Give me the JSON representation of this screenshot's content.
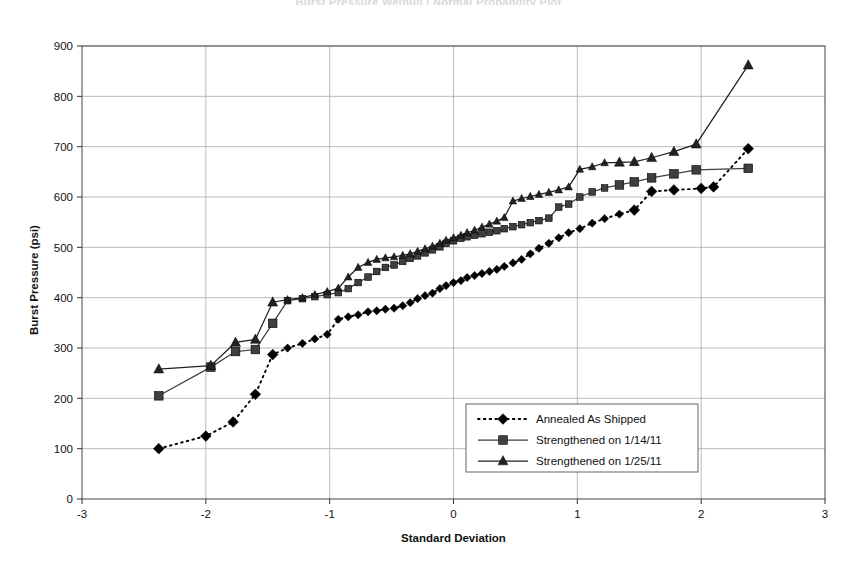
{
  "chart_data": {
    "type": "line",
    "title": "Burst Pressure Weibull / Normal Probability Plot",
    "xlabel": "Standard Deviation",
    "ylabel": "Burst Pressure (psi)",
    "xlim": [
      -3,
      3
    ],
    "ylim": [
      0,
      900
    ],
    "xticks": [
      -3,
      -2,
      -1,
      0,
      1,
      2,
      3
    ],
    "yticks": [
      0,
      100,
      200,
      300,
      400,
      500,
      600,
      700,
      800,
      900
    ],
    "grid": true,
    "legend_position": "center-right-inside",
    "series": [
      {
        "name": "Annealed As Shipped",
        "marker": "diamond",
        "line_style": "dotted",
        "color": "#000000",
        "points": [
          [
            -2.38,
            100
          ],
          [
            -2.0,
            125
          ],
          [
            -1.78,
            153
          ],
          [
            -1.6,
            208
          ],
          [
            -1.46,
            287
          ],
          [
            -1.34,
            300
          ],
          [
            -1.22,
            309
          ],
          [
            -1.12,
            318
          ],
          [
            -1.02,
            327
          ],
          [
            -0.93,
            357
          ],
          [
            -0.85,
            362
          ],
          [
            -0.77,
            366
          ],
          [
            -0.69,
            372
          ],
          [
            -0.62,
            374
          ],
          [
            -0.55,
            377
          ],
          [
            -0.48,
            379
          ],
          [
            -0.41,
            384
          ],
          [
            -0.35,
            390
          ],
          [
            -0.29,
            398
          ],
          [
            -0.23,
            404
          ],
          [
            -0.17,
            409
          ],
          [
            -0.11,
            418
          ],
          [
            -0.06,
            424
          ],
          [
            0.0,
            430
          ],
          [
            0.06,
            434
          ],
          [
            0.11,
            440
          ],
          [
            0.17,
            444
          ],
          [
            0.23,
            448
          ],
          [
            0.29,
            452
          ],
          [
            0.35,
            456
          ],
          [
            0.41,
            462
          ],
          [
            0.48,
            469
          ],
          [
            0.55,
            476
          ],
          [
            0.62,
            487
          ],
          [
            0.69,
            498
          ],
          [
            0.77,
            508
          ],
          [
            0.85,
            519
          ],
          [
            0.93,
            529
          ],
          [
            1.02,
            537
          ],
          [
            1.12,
            548
          ],
          [
            1.22,
            557
          ],
          [
            1.34,
            566
          ],
          [
            1.46,
            574
          ],
          [
            1.6,
            611
          ],
          [
            1.78,
            614
          ],
          [
            2.0,
            617
          ],
          [
            2.1,
            620
          ],
          [
            2.38,
            696
          ]
        ]
      },
      {
        "name": "Strengthened on 1/14/11",
        "marker": "square",
        "line_style": "solid",
        "color": "#3f3f3f",
        "points": [
          [
            -2.38,
            205
          ],
          [
            -1.96,
            262
          ],
          [
            -1.76,
            293
          ],
          [
            -1.6,
            297
          ],
          [
            -1.46,
            349
          ],
          [
            -1.34,
            394
          ],
          [
            -1.22,
            398
          ],
          [
            -1.12,
            402
          ],
          [
            -1.02,
            406
          ],
          [
            -0.93,
            410
          ],
          [
            -0.85,
            418
          ],
          [
            -0.77,
            430
          ],
          [
            -0.69,
            441
          ],
          [
            -0.62,
            452
          ],
          [
            -0.55,
            460
          ],
          [
            -0.48,
            465
          ],
          [
            -0.41,
            472
          ],
          [
            -0.35,
            478
          ],
          [
            -0.29,
            483
          ],
          [
            -0.23,
            489
          ],
          [
            -0.17,
            495
          ],
          [
            -0.11,
            501
          ],
          [
            -0.06,
            508
          ],
          [
            0.0,
            513
          ],
          [
            0.06,
            518
          ],
          [
            0.11,
            521
          ],
          [
            0.17,
            524
          ],
          [
            0.23,
            527
          ],
          [
            0.29,
            530
          ],
          [
            0.35,
            533
          ],
          [
            0.41,
            537
          ],
          [
            0.48,
            541
          ],
          [
            0.55,
            545
          ],
          [
            0.62,
            549
          ],
          [
            0.69,
            553
          ],
          [
            0.77,
            558
          ],
          [
            0.85,
            580
          ],
          [
            0.93,
            586
          ],
          [
            1.02,
            600
          ],
          [
            1.12,
            610
          ],
          [
            1.22,
            618
          ],
          [
            1.34,
            624
          ],
          [
            1.46,
            630
          ],
          [
            1.6,
            638
          ],
          [
            1.78,
            646
          ],
          [
            1.96,
            654
          ],
          [
            2.38,
            657
          ]
        ]
      },
      {
        "name": "Strengthened on 1/25/11",
        "marker": "triangle",
        "line_style": "solid",
        "color": "#222222",
        "points": [
          [
            -2.38,
            258
          ],
          [
            -1.96,
            265
          ],
          [
            -1.76,
            311
          ],
          [
            -1.6,
            317
          ],
          [
            -1.46,
            391
          ],
          [
            -1.34,
            396
          ],
          [
            -1.22,
            400
          ],
          [
            -1.12,
            406
          ],
          [
            -1.02,
            412
          ],
          [
            -0.93,
            419
          ],
          [
            -0.85,
            441
          ],
          [
            -0.77,
            460
          ],
          [
            -0.69,
            470
          ],
          [
            -0.62,
            476
          ],
          [
            -0.55,
            479
          ],
          [
            -0.48,
            481
          ],
          [
            -0.41,
            484
          ],
          [
            -0.35,
            487
          ],
          [
            -0.29,
            492
          ],
          [
            -0.23,
            497
          ],
          [
            -0.17,
            502
          ],
          [
            -0.11,
            508
          ],
          [
            -0.06,
            514
          ],
          [
            0.0,
            519
          ],
          [
            0.06,
            524
          ],
          [
            0.11,
            529
          ],
          [
            0.17,
            534
          ],
          [
            0.23,
            540
          ],
          [
            0.29,
            546
          ],
          [
            0.35,
            552
          ],
          [
            0.41,
            559
          ],
          [
            0.48,
            592
          ],
          [
            0.55,
            597
          ],
          [
            0.62,
            601
          ],
          [
            0.69,
            605
          ],
          [
            0.77,
            609
          ],
          [
            0.85,
            614
          ],
          [
            0.93,
            620
          ],
          [
            1.02,
            655
          ],
          [
            1.12,
            660
          ],
          [
            1.22,
            668
          ],
          [
            1.34,
            669
          ],
          [
            1.46,
            670
          ],
          [
            1.6,
            678
          ],
          [
            1.78,
            690
          ],
          [
            1.96,
            705
          ],
          [
            2.38,
            862
          ]
        ]
      }
    ]
  },
  "axes": {
    "x_tick_labels": [
      "-3",
      "-2",
      "-1",
      "0",
      "1",
      "2",
      "3"
    ],
    "y_tick_labels": [
      "0",
      "100",
      "200",
      "300",
      "400",
      "500",
      "600",
      "700",
      "800",
      "900"
    ],
    "x_title": "Standard Deviation",
    "y_title": "Burst Pressure (psi)"
  },
  "legend": {
    "entries": [
      {
        "label": "Annealed As Shipped",
        "marker": "diamond",
        "style": "dotted"
      },
      {
        "label": "Strengthened on 1/14/11",
        "marker": "square",
        "style": "solid"
      },
      {
        "label": "Strengthened on 1/25/11",
        "marker": "triangle",
        "style": "solid"
      }
    ]
  },
  "colors": {
    "plot_border": "#555555",
    "gridline": "#a8a8a8",
    "background": "#ffffff",
    "series_annealed": "#000000",
    "series_1_14": "#3f3f3f",
    "series_1_25": "#222222"
  },
  "title": {
    "text": "Burst Pressure Weibull / Normal Probability Plot"
  }
}
